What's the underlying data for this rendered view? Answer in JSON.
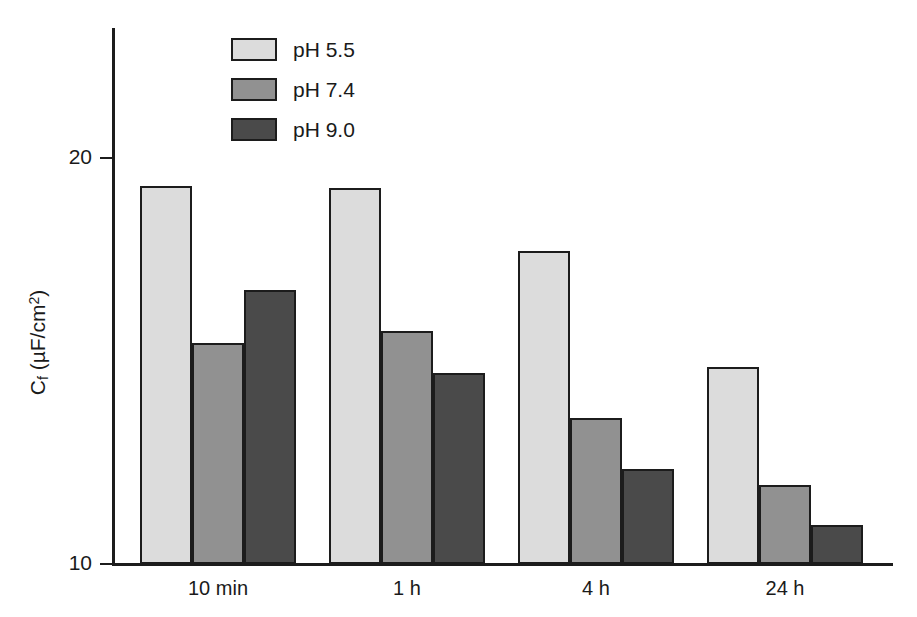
{
  "chart_data": {
    "type": "bar",
    "title": "",
    "xlabel": "",
    "ylabel": "Cf (µF/cm2)",
    "ylabel_parts": {
      "base": "C",
      "sub": "f",
      "unit_open": " (µF/cm",
      "sup": "2",
      "unit_close": ")"
    },
    "categories": [
      "10 min",
      "1 h",
      "4 h",
      "24 h"
    ],
    "ylim": [
      10,
      20
    ],
    "yticks": [
      10,
      20
    ],
    "ytick_labels": [
      "10",
      "20"
    ],
    "grid": false,
    "legend_position": "top-left-inside",
    "series": [
      {
        "name": "pH 5.5",
        "color": "#dcdcdc",
        "values": [
          19.3,
          19.25,
          17.7,
          14.85
        ]
      },
      {
        "name": "pH 7.4",
        "color": "#919191",
        "values": [
          15.45,
          15.75,
          13.6,
          11.95
        ]
      },
      {
        "name": "pH 9.0",
        "color": "#4a4a4a",
        "values": [
          16.75,
          14.7,
          12.35,
          10.95
        ]
      }
    ]
  },
  "legend": {
    "items": [
      {
        "label": "pH 5.5",
        "swatch": "light-gray-swatch"
      },
      {
        "label": "pH 7.4",
        "swatch": "medium-gray-swatch"
      },
      {
        "label": "pH 9.0",
        "swatch": "dark-gray-swatch"
      }
    ]
  },
  "axes": {
    "y_tick_top": "20",
    "y_tick_bottom": "10"
  },
  "header_artifact": {
    "left": "",
    "right": ""
  }
}
